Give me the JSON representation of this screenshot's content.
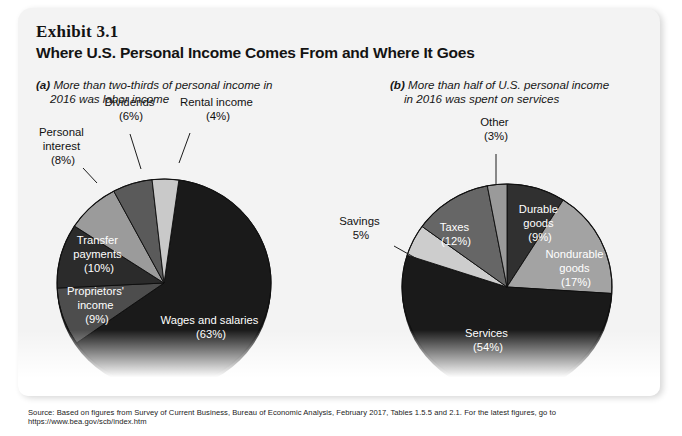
{
  "exhibit": {
    "number": "Exhibit 3.1",
    "title": "Where U.S. Personal Income Comes From and Where It Goes",
    "source": "Source: Based on figures from Survey of Current Business, Bureau of Economic Analysis, February 2017, Tables 1.5.5 and 2.1. For the latest figures, go to https://www.bea.gov/scb/index.htm"
  },
  "panels": [
    {
      "tag": "(a)",
      "caption_line1": "More than two-thirds of personal income in",
      "caption_line2": "2016 was labor income"
    },
    {
      "tag": "(b)",
      "caption_line1": "More than half of U.S. personal income",
      "caption_line2": "in 2016 was spent on services"
    }
  ],
  "chart_data": [
    {
      "type": "pie",
      "title": "More than two-thirds of personal income in 2016 was labor income",
      "panel": "(a)",
      "categories": [
        "Wages and salaries",
        "Proprietors' income",
        "Transfer payments",
        "Personal interest",
        "Dividends",
        "Rental income"
      ],
      "values": [
        63,
        9,
        10,
        8,
        6,
        4
      ],
      "labels": [
        "Wages and salaries\n(63%)",
        "Proprietors'\nincome\n(9%)",
        "Transfer\npayments\n(10%)",
        "Personal\ninterest\n(8%)",
        "Dividends\n(6%)",
        "Rental income\n(4%)"
      ],
      "colors": [
        "#1a1a1a",
        "#4d4d4d",
        "#2b2b2b",
        "#9b9b9b",
        "#5a5a5a",
        "#c9c9c9"
      ],
      "label_placement": [
        "inside",
        "inside",
        "inside",
        "outside",
        "outside",
        "outside"
      ],
      "units": "percent",
      "ylabel": "",
      "xlabel": ""
    },
    {
      "type": "pie",
      "title": "More than half of U.S. personal income in 2016 was spent on services",
      "panel": "(b)",
      "categories": [
        "Durable goods",
        "Nondurable goods",
        "Services",
        "Savings",
        "Taxes",
        "Other"
      ],
      "values": [
        9,
        17,
        54,
        5,
        12,
        3
      ],
      "labels": [
        "Durable\ngoods\n(9%)",
        "Nondurable\ngoods\n(17%)",
        "Services\n(54%)",
        "Savings\n5%",
        "Taxes\n(12%)",
        "Other\n(3%)"
      ],
      "colors": [
        "#303030",
        "#a3a3a3",
        "#1a1a1a",
        "#cdcdcd",
        "#666666",
        "#9a9a9a"
      ],
      "label_placement": [
        "inside",
        "inside",
        "inside",
        "outside",
        "inside",
        "outside"
      ],
      "units": "percent",
      "ylabel": "",
      "xlabel": ""
    }
  ],
  "chart_a_inside_labels": {
    "wages_l1": "Wages and salaries",
    "wages_l2": "(63%)",
    "proprietors_l1": "Proprietors'",
    "proprietors_l2": "income",
    "proprietors_l3": "(9%)",
    "transfer_l1": "Transfer",
    "transfer_l2": "payments",
    "transfer_l3": "(10%)"
  },
  "chart_a_outside_labels": {
    "interest_l1": "Personal",
    "interest_l2": "interest",
    "interest_l3": "(8%)",
    "dividends_l1": "Dividends",
    "dividends_l2": "(6%)",
    "rental_l1": "Rental income",
    "rental_l2": "(4%)"
  },
  "chart_b_inside_labels": {
    "durable_l1": "Durable",
    "durable_l2": "goods",
    "durable_l3": "(9%)",
    "nondurable_l1": "Nondurable",
    "nondurable_l2": "goods",
    "nondurable_l3": "(17%)",
    "services_l1": "Services",
    "services_l2": "(54%)",
    "taxes_l1": "Taxes",
    "taxes_l2": "(12%)"
  },
  "chart_b_outside_labels": {
    "savings_l1": "Savings",
    "savings_l2": "5%",
    "other_l1": "Other",
    "other_l2": "(3%)"
  }
}
